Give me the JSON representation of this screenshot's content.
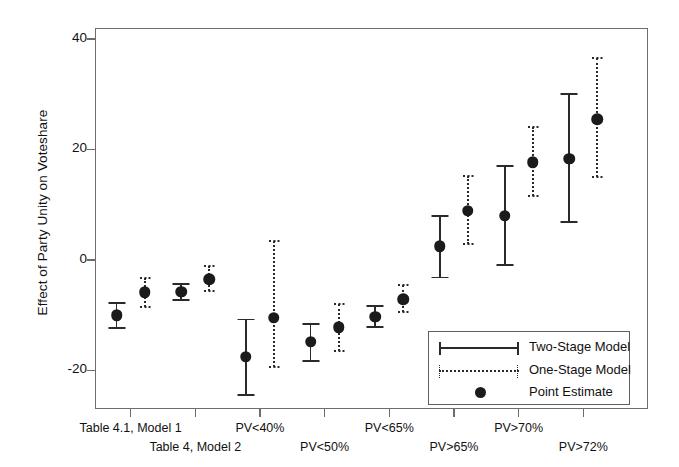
{
  "chart_data": {
    "type": "scatter",
    "title": "",
    "xlabel": "",
    "ylabel": "Effect of Party Unity on Voteshare",
    "ylim": [
      -27,
      42
    ],
    "yticks": [
      -20,
      0,
      20,
      40
    ],
    "ytick_labels": [
      "-20",
      "0",
      "20",
      "40"
    ],
    "grid": false,
    "legend_position": "bottom-right",
    "categories": [
      "Table 4.1, Model 1",
      "Table 4, Model 2",
      "PV<40%",
      "PV<50%",
      "PV<65%",
      "PV>65%",
      "PV>70%",
      "PV>72%"
    ],
    "series": [
      {
        "name": "Two-Stage Model",
        "style": "solid",
        "estimates": [
          -10.0,
          -5.8,
          -17.5,
          -14.8,
          -10.3,
          2.5,
          8.0,
          18.3
        ],
        "ci_low": [
          -12.4,
          -7.3,
          -24.5,
          -18.3,
          -12.2,
          -3.2,
          -1.0,
          6.8
        ],
        "ci_high": [
          -7.8,
          -4.3,
          -10.8,
          -11.6,
          -8.4,
          7.9,
          17.0,
          30.0
        ]
      },
      {
        "name": "One-Stage Model",
        "style": "dotted",
        "estimates": [
          -5.9,
          -3.5,
          -10.5,
          -12.2,
          -7.1,
          8.9,
          17.7,
          25.5
        ],
        "ci_low": [
          -8.6,
          -5.6,
          -19.4,
          -16.5,
          -9.5,
          2.8,
          11.5,
          15.0
        ],
        "ci_high": [
          -3.3,
          -1.1,
          3.5,
          -8.0,
          -4.6,
          15.2,
          24.0,
          36.5
        ]
      }
    ],
    "legend_entries": [
      {
        "label": "Two-Stage Model",
        "marker": "solid-line-with-caps"
      },
      {
        "label": "One-Stage Model",
        "marker": "dotted-line-with-caps"
      },
      {
        "label": "Point Estimate",
        "marker": "filled-circle"
      }
    ]
  },
  "colors": {
    "axis": "#6d6d6d",
    "data": "#2a2a2a",
    "point": "#1b1b1b",
    "background": "#ffffff"
  }
}
